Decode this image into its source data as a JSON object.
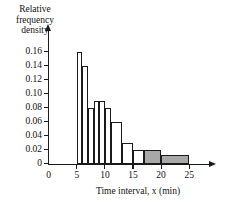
{
  "chart_data": {
    "type": "bar",
    "title": "",
    "subtitle": "",
    "xlabel": "Time interval, x (min)",
    "ylabel": "Relative frequency density",
    "ylabel_lines": [
      "Relative",
      "frequency",
      "density"
    ],
    "xlim": [
      0,
      27
    ],
    "ylim": [
      0,
      0.172
    ],
    "grid": false,
    "legend": null,
    "x_ticks": [
      0,
      5,
      10,
      15,
      20,
      25
    ],
    "x_tick_labels": [
      "0",
      "5",
      "10",
      "15",
      "20",
      "25"
    ],
    "y_ticks": [
      0,
      0.02,
      0.04,
      0.06,
      0.08,
      0.1,
      0.12,
      0.14,
      0.16
    ],
    "y_tick_labels": [
      "0",
      "0.02",
      "0.04",
      "0.06",
      "0.08",
      "0.10",
      "0.12",
      "0.14",
      "0.16"
    ],
    "bin_edges": [
      5,
      6,
      7,
      8,
      9,
      10,
      11,
      13,
      15,
      17,
      20,
      25
    ],
    "values": [
      0.16,
      0.14,
      0.08,
      0.09,
      0.09,
      0.08,
      0.06,
      0.03,
      0.02,
      0.02,
      0.013
    ],
    "bars": [
      {
        "x0": 5,
        "x1": 6,
        "height": 0.16,
        "shaded": false
      },
      {
        "x0": 6,
        "x1": 7,
        "height": 0.14,
        "shaded": false
      },
      {
        "x0": 7,
        "x1": 8,
        "height": 0.08,
        "shaded": false
      },
      {
        "x0": 8,
        "x1": 9,
        "height": 0.09,
        "shaded": false
      },
      {
        "x0": 9,
        "x1": 10,
        "height": 0.09,
        "shaded": false
      },
      {
        "x0": 10,
        "x1": 11,
        "height": 0.08,
        "shaded": false
      },
      {
        "x0": 11,
        "x1": 13,
        "height": 0.06,
        "shaded": false
      },
      {
        "x0": 13,
        "x1": 15,
        "height": 0.03,
        "shaded": false
      },
      {
        "x0": 15,
        "x1": 17,
        "height": 0.02,
        "shaded": false
      },
      {
        "x0": 17,
        "x1": 20,
        "height": 0.02,
        "shaded": true
      },
      {
        "x0": 20,
        "x1": 25,
        "height": 0.013,
        "shaded": true
      }
    ],
    "colors": {
      "bar_fill": "#ffffff",
      "bar_shaded_fill": "#a8a8a8",
      "bar_edge": "#1a1a1a",
      "axis": "#1a1a1a",
      "text": "#111111",
      "background": "#ffffff"
    }
  }
}
